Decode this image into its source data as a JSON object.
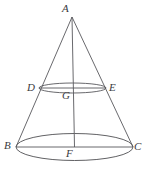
{
  "figure": {
    "stroke_color": "#58585c",
    "label_color": "#3a3a3e",
    "background_color": "#ffffff",
    "width": 148,
    "height": 169,
    "vertices": [
      {
        "id": "A",
        "label": "A",
        "role": "apex",
        "x": 72,
        "y": 17,
        "label_x": 62,
        "label_y": 3
      },
      {
        "id": "D",
        "label": "D",
        "role": "upper-circle-left",
        "x": 39,
        "y": 88,
        "label_x": 27,
        "label_y": 82
      },
      {
        "id": "E",
        "label": "E",
        "role": "upper-circle-right",
        "x": 106,
        "y": 88,
        "label_x": 109,
        "label_y": 82
      },
      {
        "id": "G",
        "label": "G",
        "role": "upper-circle-center",
        "x": 72.5,
        "y": 90,
        "label_x": 62,
        "label_y": 90
      },
      {
        "id": "B",
        "label": "B",
        "role": "base-circle-left",
        "x": 16,
        "y": 147,
        "label_x": 4,
        "label_y": 140
      },
      {
        "id": "C",
        "label": "C",
        "role": "base-circle-right",
        "x": 133,
        "y": 147,
        "label_x": 134,
        "label_y": 141
      },
      {
        "id": "F",
        "label": "F",
        "role": "base-circle-center",
        "x": 74.5,
        "y": 147,
        "label_x": 66,
        "label_y": 148
      }
    ],
    "upper_ellipse": {
      "cx": 72.5,
      "cy": 88,
      "rx": 33.5,
      "ry": 5
    },
    "lower_ellipse": {
      "cx": 74.5,
      "cy": 147,
      "rx": 58.5,
      "ry": 13.5
    },
    "segments": [
      {
        "name": "slant-left",
        "from": "A",
        "to": "B"
      },
      {
        "name": "slant-right",
        "from": "A",
        "to": "C"
      },
      {
        "name": "axis",
        "from": "A",
        "to": "F"
      },
      {
        "name": "chord-DE",
        "from": "D",
        "to": "E"
      },
      {
        "name": "chord-BC",
        "from": "B",
        "to": "C"
      }
    ]
  }
}
